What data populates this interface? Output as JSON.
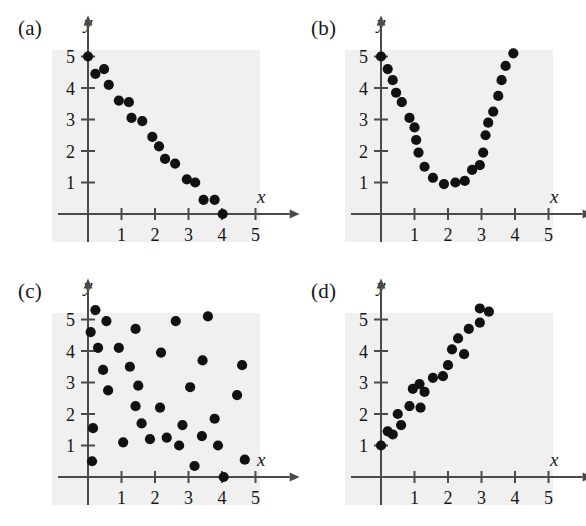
{
  "figure": {
    "title": "",
    "panel_count": 4
  },
  "axes": {
    "x_label": "x",
    "y_label": "y",
    "x_ticks": [
      "1",
      "2",
      "3",
      "4",
      "5"
    ],
    "y_ticks": [
      "1",
      "2",
      "3",
      "4",
      "5"
    ],
    "x_tick_values": [
      1,
      2,
      3,
      4,
      5
    ],
    "y_tick_values": [
      1,
      2,
      3,
      4,
      5
    ],
    "xlim": [
      0,
      5.6
    ],
    "ylim": [
      0,
      5.6
    ],
    "grid": false,
    "background_color": "#f0f0f0",
    "axis_color": "#4a4a4a",
    "dot_color": "#111111"
  },
  "panels": [
    {
      "id": "a",
      "label": "(a)",
      "position": "top-left"
    },
    {
      "id": "b",
      "label": "(b)",
      "position": "top-right"
    },
    {
      "id": "c",
      "label": "(c)",
      "position": "bottom-left"
    },
    {
      "id": "d",
      "label": "(d)",
      "position": "bottom-right"
    }
  ],
  "chart_data": [
    {
      "type": "scatter",
      "panel": "a",
      "title": "(a)",
      "xlabel": "x",
      "ylabel": "y",
      "xlim": [
        0,
        5.6
      ],
      "ylim": [
        0,
        5.6
      ],
      "grid": false,
      "pattern": "negative-linear",
      "points": [
        [
          0.0,
          5.0
        ],
        [
          0.22,
          4.45
        ],
        [
          0.48,
          4.6
        ],
        [
          0.62,
          4.1
        ],
        [
          0.92,
          3.6
        ],
        [
          1.22,
          3.55
        ],
        [
          1.3,
          3.05
        ],
        [
          1.62,
          2.95
        ],
        [
          1.92,
          2.45
        ],
        [
          2.12,
          2.15
        ],
        [
          2.3,
          1.75
        ],
        [
          2.6,
          1.6
        ],
        [
          2.95,
          1.1
        ],
        [
          3.2,
          1.0
        ],
        [
          3.45,
          0.45
        ],
        [
          3.78,
          0.45
        ],
        [
          4.02,
          0.0
        ]
      ]
    },
    {
      "type": "scatter",
      "panel": "b",
      "title": "(b)",
      "xlabel": "x",
      "ylabel": "y",
      "xlim": [
        0,
        5.6
      ],
      "ylim": [
        0,
        5.6
      ],
      "grid": false,
      "pattern": "parabolic-u-shape",
      "points": [
        [
          0.0,
          5.0
        ],
        [
          0.2,
          4.6
        ],
        [
          0.35,
          4.25
        ],
        [
          0.45,
          3.85
        ],
        [
          0.62,
          3.55
        ],
        [
          0.85,
          3.05
        ],
        [
          1.0,
          2.75
        ],
        [
          1.05,
          2.35
        ],
        [
          1.12,
          1.95
        ],
        [
          1.3,
          1.5
        ],
        [
          1.55,
          1.15
        ],
        [
          1.88,
          0.95
        ],
        [
          2.22,
          1.0
        ],
        [
          2.5,
          1.05
        ],
        [
          2.72,
          1.4
        ],
        [
          2.95,
          1.55
        ],
        [
          3.05,
          1.95
        ],
        [
          3.12,
          2.5
        ],
        [
          3.2,
          2.9
        ],
        [
          3.35,
          3.25
        ],
        [
          3.5,
          3.75
        ],
        [
          3.6,
          4.25
        ],
        [
          3.72,
          4.7
        ],
        [
          3.95,
          5.1
        ]
      ]
    },
    {
      "type": "scatter",
      "panel": "c",
      "title": "(c)",
      "xlabel": "x",
      "ylabel": "y",
      "xlim": [
        0,
        5.6
      ],
      "ylim": [
        0,
        5.6
      ],
      "grid": false,
      "pattern": "no-correlation-random",
      "points": [
        [
          0.22,
          5.3
        ],
        [
          0.08,
          4.6
        ],
        [
          0.3,
          4.1
        ],
        [
          0.55,
          4.95
        ],
        [
          0.45,
          3.4
        ],
        [
          0.6,
          2.75
        ],
        [
          0.15,
          1.55
        ],
        [
          0.12,
          0.5
        ],
        [
          0.92,
          4.1
        ],
        [
          1.05,
          1.1
        ],
        [
          1.42,
          4.7
        ],
        [
          1.25,
          3.5
        ],
        [
          1.5,
          2.9
        ],
        [
          1.42,
          2.25
        ],
        [
          1.6,
          1.7
        ],
        [
          1.85,
          1.2
        ],
        [
          2.18,
          3.95
        ],
        [
          2.15,
          2.2
        ],
        [
          2.35,
          1.25
        ],
        [
          2.62,
          4.95
        ],
        [
          2.72,
          1.0
        ],
        [
          2.82,
          1.65
        ],
        [
          3.05,
          2.85
        ],
        [
          3.18,
          0.35
        ],
        [
          3.4,
          1.3
        ],
        [
          3.42,
          3.7
        ],
        [
          3.58,
          5.1
        ],
        [
          3.78,
          1.85
        ],
        [
          3.88,
          1.0
        ],
        [
          4.05,
          0.0
        ],
        [
          4.45,
          2.6
        ],
        [
          4.6,
          3.55
        ],
        [
          4.68,
          0.55
        ]
      ]
    },
    {
      "type": "scatter",
      "panel": "d",
      "title": "(d)",
      "xlabel": "x",
      "ylabel": "y",
      "xlim": [
        0,
        5.6
      ],
      "ylim": [
        0,
        5.6
      ],
      "grid": false,
      "pattern": "positive-linear",
      "points": [
        [
          0.0,
          1.0
        ],
        [
          0.2,
          1.45
        ],
        [
          0.35,
          1.35
        ],
        [
          0.5,
          2.0
        ],
        [
          0.6,
          1.65
        ],
        [
          0.85,
          2.25
        ],
        [
          0.95,
          2.8
        ],
        [
          1.15,
          2.95
        ],
        [
          1.18,
          2.2
        ],
        [
          1.3,
          2.7
        ],
        [
          1.55,
          3.15
        ],
        [
          1.85,
          3.2
        ],
        [
          2.0,
          3.55
        ],
        [
          2.12,
          4.05
        ],
        [
          2.3,
          4.4
        ],
        [
          2.48,
          3.9
        ],
        [
          2.62,
          4.7
        ],
        [
          2.95,
          5.35
        ],
        [
          2.95,
          4.9
        ],
        [
          3.22,
          5.25
        ]
      ]
    }
  ]
}
